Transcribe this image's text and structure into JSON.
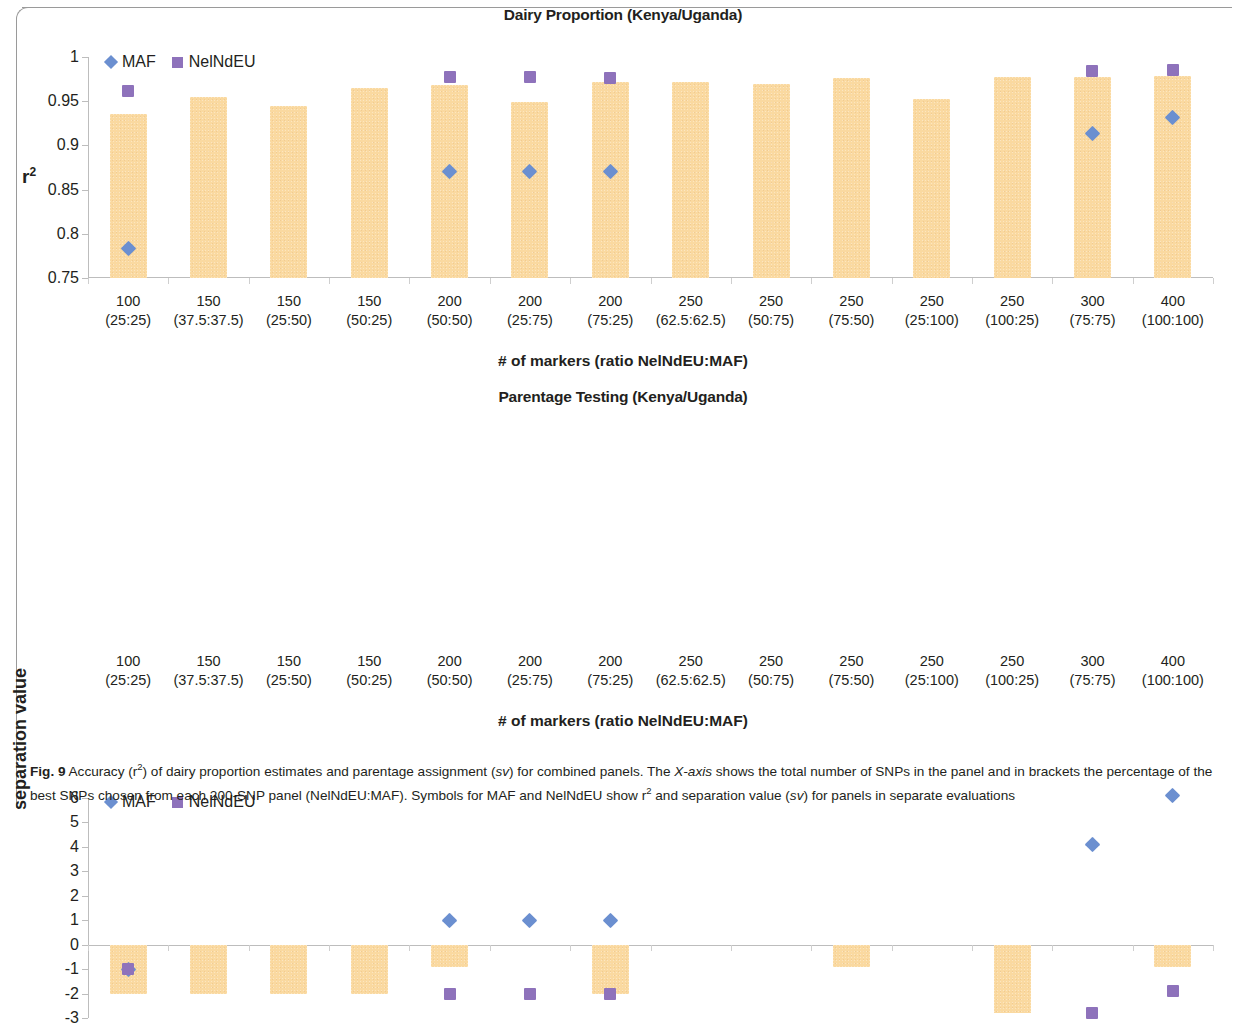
{
  "figure": {
    "label": "Fig. 9",
    "caption_parts": {
      "p1": " Accuracy (r",
      "sup1": "2",
      "p2": ") of dairy proportion estimates and parentage assignment (",
      "i1": "sv",
      "p3": ") for combined panels. The ",
      "i2": "X-axis",
      "p4": " shows the total number of SNPs in the panel and in brackets the percentage of the best SNPs chosen from each 200-SNP panel (NelNdEU:MAF). Symbols for MAF and NelNdEU show r",
      "sup2": "2",
      "p5": " and separation value (",
      "i3": "sv",
      "p6": ") for panels in separate evaluations"
    }
  },
  "legend": {
    "maf_label": "MAF",
    "nelndeu_label": "NelNdEU",
    "maf_color": "#6b8fd0",
    "nelndeu_color": "#8e72bb",
    "bar_color": "#fad9a0"
  },
  "categories": [
    {
      "n": "100",
      "r": "(25:25)"
    },
    {
      "n": "150",
      "r": "(37.5:37.5)"
    },
    {
      "n": "150",
      "r": "(25:50)"
    },
    {
      "n": "150",
      "r": "(50:25)"
    },
    {
      "n": "200",
      "r": "(50:50)"
    },
    {
      "n": "200",
      "r": "(25:75)"
    },
    {
      "n": "200",
      "r": "(75:25)"
    },
    {
      "n": "250",
      "r": "(62.5:62.5)"
    },
    {
      "n": "250",
      "r": "(50:75)"
    },
    {
      "n": "250",
      "r": "(75:50)"
    },
    {
      "n": "250",
      "r": "(25:100)"
    },
    {
      "n": "250",
      "r": "(100:25)"
    },
    {
      "n": "300",
      "r": "(75:75)"
    },
    {
      "n": "400",
      "r": "(100:100)"
    }
  ],
  "chart_data": [
    {
      "type": "bar",
      "id": "dairy",
      "title": "Dairy Proportion (Kenya/Uganda)",
      "xlabel": "# of markers (ratio NelNdEU:MAF)",
      "ylabel": "r2",
      "ylabel_display": "r",
      "ylabel_sup": "2",
      "ylim": [
        0.75,
        1
      ],
      "yticks": [
        0.75,
        0.8,
        0.85,
        0.9,
        0.95,
        1
      ],
      "ytick_labels": [
        "0.75",
        "0.8",
        "0.85",
        "0.9",
        "0.95",
        "1"
      ],
      "grid": false,
      "legend_position": "top-left",
      "categories": [
        "100 (25:25)",
        "150 (37.5:37.5)",
        "150 (25:50)",
        "150 (50:25)",
        "200 (50:50)",
        "200 (25:75)",
        "200 (75:25)",
        "250 (62.5:62.5)",
        "250 (50:75)",
        "250 (75:50)",
        "250 (25:100)",
        "250 (100:25)",
        "300 (75:75)",
        "400 (100:100)"
      ],
      "series": [
        {
          "name": "Combined panel r2",
          "kind": "bar",
          "values": [
            0.936,
            0.955,
            0.945,
            0.965,
            0.968,
            0.949,
            0.972,
            0.972,
            0.969,
            0.976,
            0.953,
            0.977,
            0.977,
            0.978
          ]
        },
        {
          "name": "MAF",
          "kind": "marker",
          "marker": "diamond",
          "values": [
            0.783,
            null,
            null,
            null,
            0.871,
            0.871,
            0.871,
            null,
            null,
            null,
            null,
            null,
            0.913,
            0.932
          ]
        },
        {
          "name": "NelNdEU",
          "kind": "marker",
          "marker": "square",
          "values": [
            0.961,
            null,
            null,
            null,
            0.977,
            0.977,
            0.976,
            null,
            null,
            null,
            null,
            null,
            0.984,
            0.985
          ]
        }
      ]
    },
    {
      "type": "bar",
      "id": "parentage",
      "title": "Parentage Testing (Kenya/Uganda)",
      "xlabel": "# of markers (ratio NelNdEU:MAF)",
      "ylabel": "separation value",
      "ylim": [
        -3,
        6
      ],
      "yticks": [
        -3,
        -2,
        -1,
        0,
        1,
        2,
        3,
        4,
        5,
        6
      ],
      "ytick_labels": [
        "-3",
        "-2",
        "-1",
        "0",
        "1",
        "2",
        "3",
        "4",
        "5",
        "6"
      ],
      "grid": false,
      "legend_position": "top-left",
      "categories": [
        "100 (25:25)",
        "150 (37.5:37.5)",
        "150 (25:50)",
        "150 (50:25)",
        "200 (50:50)",
        "200 (25:75)",
        "200 (75:25)",
        "250 (62.5:62.5)",
        "250 (50:75)",
        "250 (75:50)",
        "250 (25:100)",
        "250 (100:25)",
        "300 (75:75)",
        "400 (100:100)"
      ],
      "series": [
        {
          "name": "Combined panel sv",
          "kind": "bar",
          "values": [
            -2,
            -2,
            -2,
            -2,
            -0.9,
            0,
            -2,
            0,
            0,
            -0.9,
            0,
            -2.8,
            0,
            -0.9
          ]
        },
        {
          "name": "MAF",
          "kind": "marker",
          "marker": "diamond",
          "values": [
            -1,
            null,
            null,
            null,
            1,
            1,
            1,
            null,
            null,
            null,
            null,
            null,
            4.1,
            6.1
          ]
        },
        {
          "name": "NelNdEU",
          "kind": "marker",
          "marker": "square",
          "values": [
            -1,
            null,
            null,
            null,
            -2,
            -2,
            -2,
            null,
            null,
            null,
            null,
            null,
            -2.8,
            -1.9
          ]
        }
      ]
    }
  ]
}
